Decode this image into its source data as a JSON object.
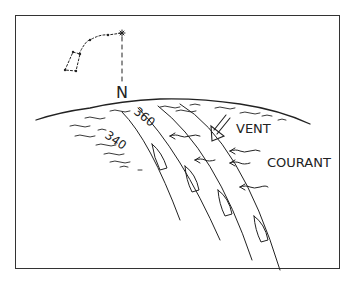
{
  "diagram": {
    "north_label": "N",
    "wind_label": "VENT",
    "current_label": "COURANT",
    "heading_labels": [
      "340",
      "360"
    ],
    "colors": {
      "ink": "#222222",
      "background": "#ffffff"
    }
  }
}
